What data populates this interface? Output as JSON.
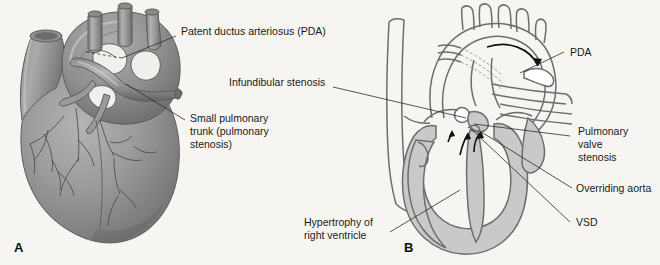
{
  "figure": {
    "background_color": "#f6f5f1",
    "panels": [
      {
        "letter": "A",
        "name": "external-heart-view",
        "style": "shaded grayscale anatomic rendering",
        "labels": [
          {
            "id": "pda",
            "text": "Patent ductus arteriosus (PDA)"
          },
          {
            "id": "pulmonary-trunk",
            "lines": [
              "Small pulmonary",
              "trunk (pulmonary",
              "stenosis)"
            ]
          }
        ]
      },
      {
        "letter": "B",
        "name": "heart-cross-section-view",
        "style": "black and white line diagram with gray myocardium",
        "labels": [
          {
            "id": "infundibular-stenosis",
            "text": "Infundibular stenosis"
          },
          {
            "id": "pda",
            "text": "PDA"
          },
          {
            "id": "pulmonary-valve-stenosis",
            "lines": [
              "Pulmonary",
              "valve",
              "stenosis"
            ]
          },
          {
            "id": "overriding-aorta",
            "text": "Overriding aorta"
          },
          {
            "id": "vsd",
            "text": "VSD"
          },
          {
            "id": "hypertrophy",
            "lines": [
              "Hypertrophy of",
              "right ventricle"
            ]
          }
        ]
      }
    ],
    "colors": {
      "label_text": "#1a1a1a",
      "leader_line": "#2b2b2b",
      "lineart_stroke": "#6d6d6d",
      "myocardium_fill": "#c9c9c9",
      "heart_dark": "#8e8e8e",
      "heart_mid": "#9e9e9e"
    }
  }
}
